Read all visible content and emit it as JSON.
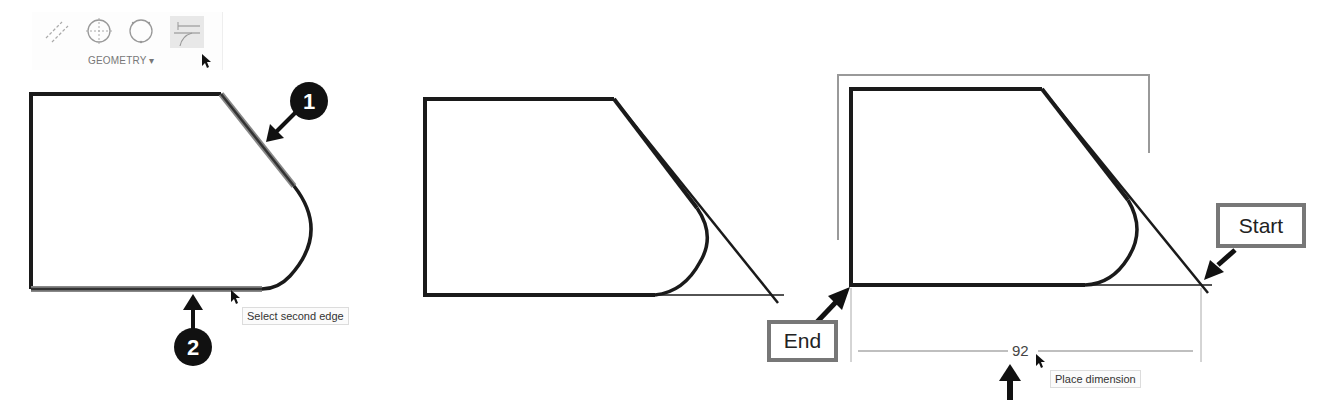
{
  "toolbar": {
    "group_label": "GEOMETRY ▾",
    "tools": [
      {
        "name": "construction-lines-icon",
        "active": false
      },
      {
        "name": "center-point-circle-icon",
        "active": false
      },
      {
        "name": "three-point-circle-icon",
        "active": false
      },
      {
        "name": "fillet-trim-icon",
        "active": true
      }
    ]
  },
  "panel1": {
    "callout1": "1",
    "callout2": "2",
    "tooltip": "Select second edge"
  },
  "panel3": {
    "start_label": "Start",
    "end_label": "End",
    "dimension_value": "92",
    "tooltip": "Place dimension"
  },
  "colors": {
    "stroke": "#1a1a1a",
    "highlight": "#888888",
    "label_border": "#777777",
    "dimension": "#9a9a9a"
  }
}
